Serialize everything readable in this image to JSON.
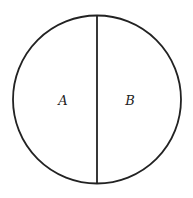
{
  "diagram": {
    "type": "circle-divided",
    "stroke_color": "#222222",
    "background": "#ffffff",
    "circle": {
      "cx": 97,
      "cy": 99.5,
      "r": 84
    },
    "divider": {
      "x": 97,
      "y1": 15.5,
      "y2": 183.5
    },
    "regions": [
      {
        "label": "A",
        "x": 63,
        "y": 105
      },
      {
        "label": "B",
        "x": 130,
        "y": 105
      }
    ]
  }
}
